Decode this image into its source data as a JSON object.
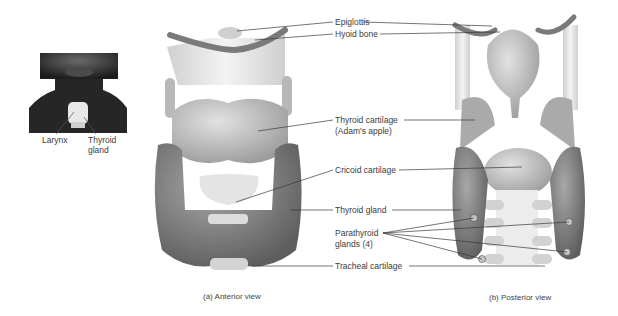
{
  "inset": {
    "labels": {
      "larynx": "Larynx",
      "thyroid_gland_line1": "Thyroid",
      "thyroid_gland_line2": "gland"
    }
  },
  "labels": {
    "epiglottis": "Epiglottis",
    "hyoid_bone": "Hyoid bone",
    "thyroid_cartilage_line1": "Thyroid cartilage",
    "thyroid_cartilage_line2": "(Adam's apple)",
    "cricoid_cartilage": "Cricoid cartilage",
    "thyroid_gland": "Thyroid gland",
    "parathyroid_line1": "Parathyroid",
    "parathyroid_line2": "glands (4)",
    "tracheal_cartilage": "Tracheal cartilage"
  },
  "captions": {
    "anterior": "(a) Anterior view",
    "posterior": "(b) Posterior view"
  },
  "colors": {
    "background": "#ffffff",
    "leader_line": "#3a3a3a",
    "cartilage": "#c9c9c9",
    "membrane": "#e6e6e6",
    "gland": "#8c8c8c",
    "skin": "#2a2a2a"
  }
}
